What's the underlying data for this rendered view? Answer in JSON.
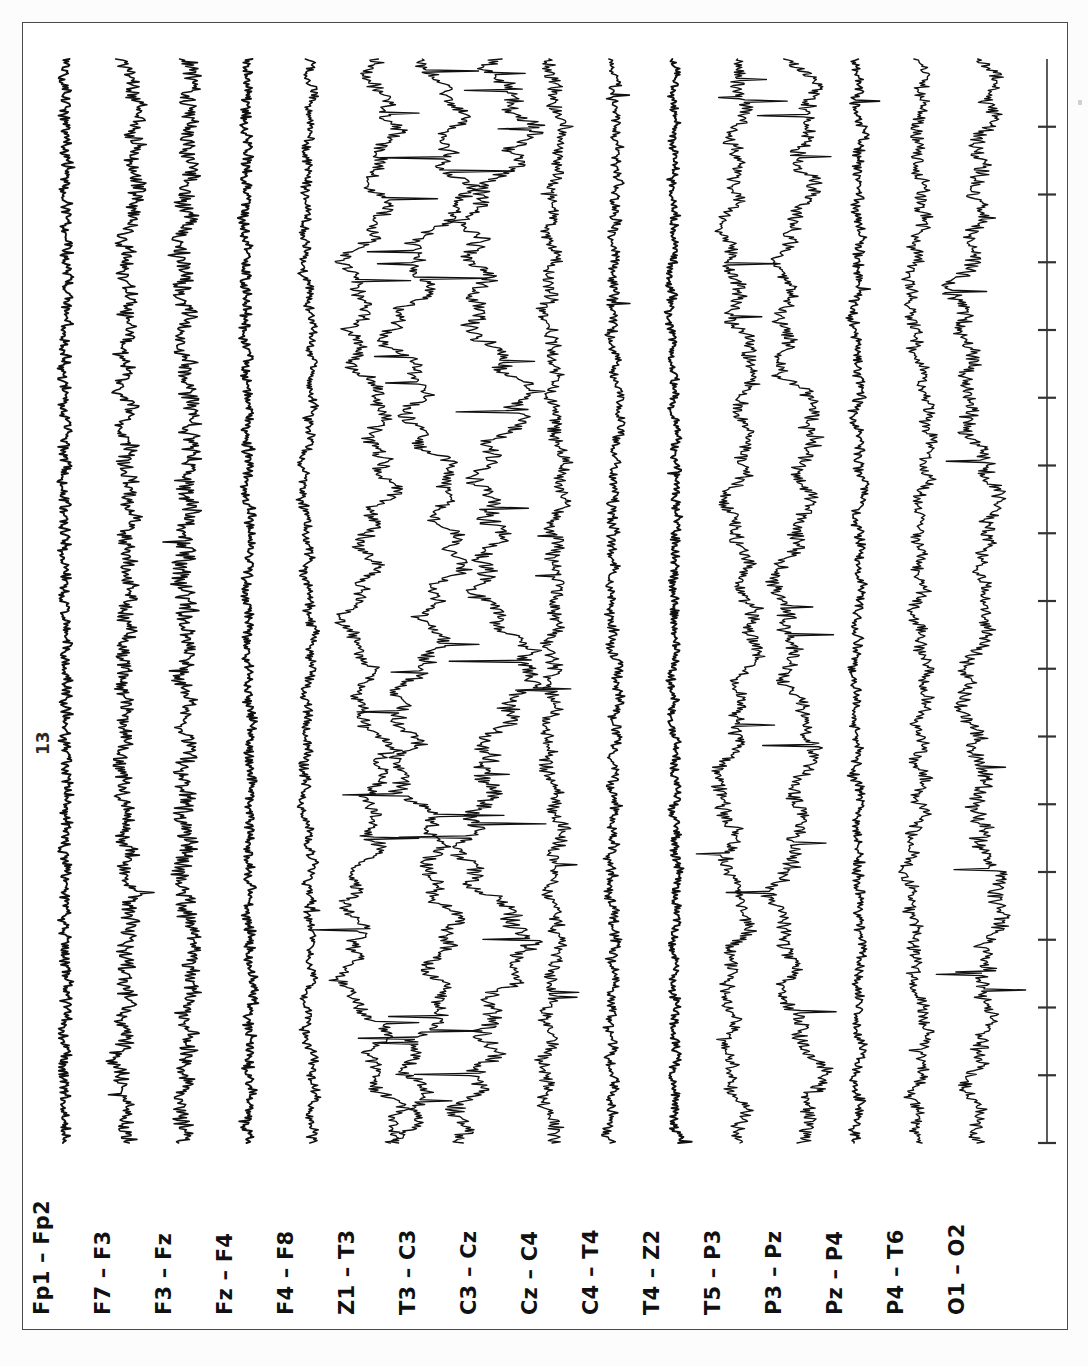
{
  "document": {
    "type": "EEG chart recording",
    "orientation": "rotated-90",
    "scale_annotation": "13"
  },
  "channels": [
    {
      "label": "Fp1 – Fp2"
    },
    {
      "label": "F7 – F3"
    },
    {
      "label": "F3 – Fz"
    },
    {
      "label": "Fz – F4"
    },
    {
      "label": "F4 – F8"
    },
    {
      "label": "Z1 – T3"
    },
    {
      "label": "T3 – C3"
    },
    {
      "label": "C3 – Cz"
    },
    {
      "label": "Cz – C4"
    },
    {
      "label": "C4 – T4"
    },
    {
      "label": "T4 – Z2"
    },
    {
      "label": "T5 – P3"
    },
    {
      "label": "P3 – Pz"
    },
    {
      "label": "Pz – P4"
    },
    {
      "label": "P4 – T6"
    },
    {
      "label": "O1 – O2"
    }
  ],
  "chart_data": {
    "type": "line",
    "title": "",
    "subtitle": "",
    "xlabel": "",
    "ylabel": "",
    "orientation": "vertical-traces-rotated-90",
    "grid": false,
    "legend_position": "none",
    "trace_color": "#101010",
    "axis_color": "#333333",
    "time_axis": {
      "present": true,
      "position": "rightmost-column",
      "tick_count": 16,
      "tick_labels": []
    },
    "categories": [
      "Fp1 – Fp2",
      "F7 – F3",
      "F3 – Fz",
      "Fz – F4",
      "F4 – F8",
      "Z1 – T3",
      "T3 – C3",
      "C3 – Cz",
      "Cz – C4",
      "C4 – T4",
      "T4 – Z2",
      "T5 – P3",
      "P3 – Pz",
      "Pz – P4",
      "P4 – T6",
      "O1 – O2"
    ],
    "series": [
      {
        "name": "Fp1 – Fp2",
        "amplitude": 5,
        "roughness": 0.95,
        "slow_wave": 0.1,
        "spikes": 0.02,
        "seed": 101
      },
      {
        "name": "F7 – F3",
        "amplitude": 11,
        "roughness": 0.7,
        "slow_wave": 0.35,
        "spikes": 0.12,
        "seed": 202
      },
      {
        "name": "F3 – Fz",
        "amplitude": 10,
        "roughness": 0.85,
        "slow_wave": 0.3,
        "spikes": 0.1,
        "seed": 303
      },
      {
        "name": "Fz – F4",
        "amplitude": 6,
        "roughness": 0.8,
        "slow_wave": 0.18,
        "spikes": 0.05,
        "seed": 404
      },
      {
        "name": "F4 – F8",
        "amplitude": 8,
        "roughness": 0.55,
        "slow_wave": 0.4,
        "spikes": 0.08,
        "seed": 505
      },
      {
        "name": "Z1 – T3",
        "amplitude": 20,
        "roughness": 0.35,
        "slow_wave": 0.8,
        "spikes": 0.3,
        "seed": 606
      },
      {
        "name": "T3 – C3",
        "amplitude": 24,
        "roughness": 0.3,
        "slow_wave": 0.9,
        "spikes": 0.45,
        "seed": 707
      },
      {
        "name": "C3 – Cz",
        "amplitude": 26,
        "roughness": 0.35,
        "slow_wave": 0.88,
        "spikes": 0.5,
        "seed": 808
      },
      {
        "name": "Cz – C4",
        "amplitude": 12,
        "roughness": 0.55,
        "slow_wave": 0.45,
        "spikes": 0.18,
        "seed": 909
      },
      {
        "name": "C4 – T4",
        "amplitude": 8,
        "roughness": 0.6,
        "slow_wave": 0.3,
        "spikes": 0.08,
        "seed": 110
      },
      {
        "name": "T4 – Z2",
        "amplitude": 6,
        "roughness": 0.65,
        "slow_wave": 0.22,
        "spikes": 0.04,
        "seed": 211
      },
      {
        "name": "T5 – P3",
        "amplitude": 15,
        "roughness": 0.45,
        "slow_wave": 0.6,
        "spikes": 0.28,
        "seed": 312
      },
      {
        "name": "P3 – Pz",
        "amplitude": 19,
        "roughness": 0.4,
        "slow_wave": 0.7,
        "spikes": 0.35,
        "seed": 413
      },
      {
        "name": "Pz – P4",
        "amplitude": 8,
        "roughness": 0.6,
        "slow_wave": 0.28,
        "spikes": 0.08,
        "seed": 514
      },
      {
        "name": "P4 – T6",
        "amplitude": 12,
        "roughness": 0.5,
        "slow_wave": 0.45,
        "spikes": 0.15,
        "seed": 615
      },
      {
        "name": "O1 – O2",
        "amplitude": 17,
        "roughness": 0.45,
        "slow_wave": 0.62,
        "spikes": 0.22,
        "seed": 716
      }
    ]
  },
  "layout": {
    "trace_x_start": 42,
    "trace_spacing": 61,
    "trace_top": 36,
    "trace_bottom": 1120,
    "axis_x": 1024
  }
}
